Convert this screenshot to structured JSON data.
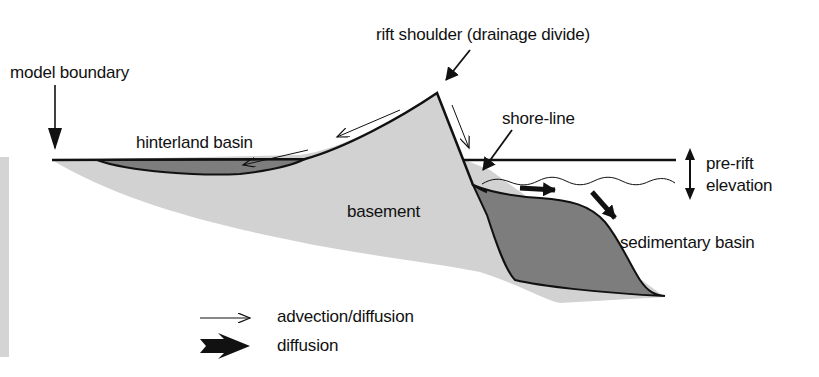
{
  "figure": {
    "labels": {
      "model_boundary": "model boundary",
      "rift_shoulder": "rift shoulder (drainage divide)",
      "hinterland_basin": "hinterland basin",
      "shore_line": "shore-line",
      "pre_rift": "pre-rift",
      "elevation": "elevation",
      "basement": "basement",
      "sedimentary_basin": "sedimentary basin"
    },
    "legend": [
      {
        "icon": "thin-arrow-icon",
        "label": "advection/diffusion"
      },
      {
        "icon": "thick-arrow-icon",
        "label": "diffusion"
      }
    ],
    "colors": {
      "basement": "#d2d2d2",
      "basin": "#7d7d7d",
      "outline": "#111111",
      "background": "#ffffff"
    }
  }
}
